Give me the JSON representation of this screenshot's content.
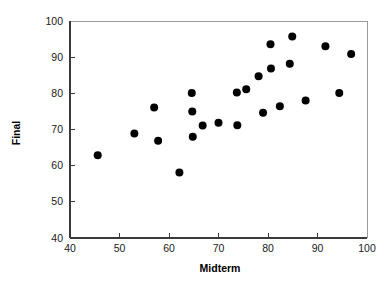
{
  "chart_data": {
    "type": "scatter",
    "title": "",
    "xlabel": "Midterm",
    "ylabel": "Final",
    "xlim": [
      40,
      100
    ],
    "ylim": [
      40,
      100
    ],
    "xticks": [
      40,
      50,
      60,
      70,
      80,
      90,
      100
    ],
    "yticks": [
      40,
      50,
      60,
      70,
      80,
      90,
      100
    ],
    "grid": false,
    "legend": false,
    "marker": "filled-circle",
    "marker_color": "#000000",
    "marker_size": 4,
    "x": [
      45.6,
      53.0,
      57.0,
      57.8,
      62.1,
      64.6,
      64.7,
      64.8,
      66.8,
      67.0,
      70.0,
      73.7,
      73.8,
      75.6,
      78.1,
      79.0,
      80.5,
      80.6,
      82.4,
      84.4,
      84.9,
      87.6,
      91.6,
      94.4,
      94.6,
      96.8
    ],
    "y": [
      62.9,
      68.9,
      76.1,
      66.9,
      58.1,
      80.1,
      75.0,
      68.0,
      71.1,
      71.1,
      71.9,
      80.2,
      71.2,
      81.1,
      84.7,
      74.6,
      93.6,
      86.9,
      76.4,
      88.2,
      95.7,
      78.0,
      93.0,
      80.1,
      80.1,
      90.9
    ],
    "points": [
      {
        "x": 45.6,
        "y": 62.9
      },
      {
        "x": 53.0,
        "y": 68.9
      },
      {
        "x": 57.0,
        "y": 76.1
      },
      {
        "x": 57.8,
        "y": 66.9
      },
      {
        "x": 62.1,
        "y": 58.1
      },
      {
        "x": 64.6,
        "y": 80.1
      },
      {
        "x": 64.7,
        "y": 75.0
      },
      {
        "x": 64.8,
        "y": 68.0
      },
      {
        "x": 66.8,
        "y": 71.1
      },
      {
        "x": 70.0,
        "y": 71.9
      },
      {
        "x": 73.7,
        "y": 80.2
      },
      {
        "x": 73.8,
        "y": 71.2
      },
      {
        "x": 75.6,
        "y": 81.1
      },
      {
        "x": 78.1,
        "y": 84.7
      },
      {
        "x": 79.0,
        "y": 74.6
      },
      {
        "x": 80.5,
        "y": 93.6
      },
      {
        "x": 80.6,
        "y": 86.9
      },
      {
        "x": 82.4,
        "y": 76.4
      },
      {
        "x": 84.4,
        "y": 88.2
      },
      {
        "x": 84.9,
        "y": 95.7
      },
      {
        "x": 87.6,
        "y": 78.0
      },
      {
        "x": 91.6,
        "y": 93.0
      },
      {
        "x": 94.4,
        "y": 80.1
      },
      {
        "x": 96.8,
        "y": 90.9
      }
    ]
  },
  "axes": {
    "x_label": "Midterm",
    "y_label": "Final",
    "x_tick_labels": [
      "40",
      "50",
      "60",
      "70",
      "80",
      "90",
      "100"
    ],
    "y_tick_labels": [
      "40",
      "50",
      "60",
      "70",
      "80",
      "90",
      "100"
    ]
  },
  "colors": {
    "background": "#ffffff",
    "axis": "#3a3a3a",
    "frame": "#9a9a9a",
    "marker": "#000000",
    "text": "#000000"
  }
}
